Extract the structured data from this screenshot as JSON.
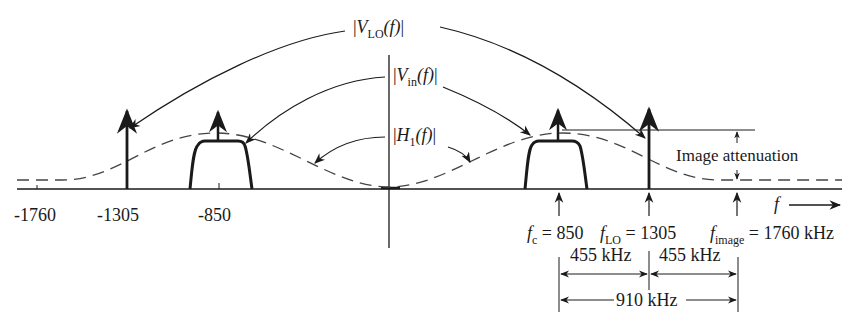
{
  "labels": {
    "v_lo": {
      "bar_open": "|",
      "var": "V",
      "sub": "LO",
      "arg": "(f)",
      "bar_close": "|"
    },
    "v_in": {
      "bar_open": "|",
      "var": "V",
      "sub": "in",
      "arg": "(f)",
      "bar_close": "|"
    },
    "h1": {
      "bar_open": "|",
      "var": "H",
      "sub": "1",
      "arg": "(f)",
      "bar_close": "|"
    },
    "image_attenuation": "Image attenuation",
    "f_axis": "f"
  },
  "axis_ticks": [
    "-1760",
    "-1305",
    "-850"
  ],
  "freq_labels": {
    "fc": {
      "var": "f",
      "sub": "c",
      "eq": "= 850"
    },
    "flo": {
      "var": "f",
      "sub": "LO",
      "eq": "= 1305"
    },
    "fimage": {
      "var": "f",
      "sub": "image",
      "eq": "= 1760 kHz"
    }
  },
  "dimensions": {
    "span1": "455 kHz",
    "span2": "455 kHz",
    "total": "910 kHz"
  }
}
